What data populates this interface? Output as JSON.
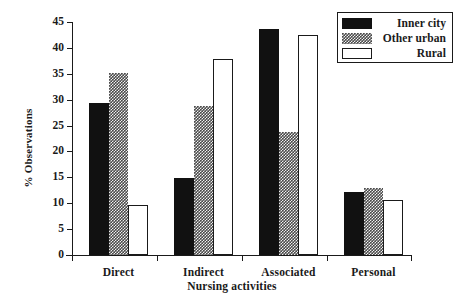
{
  "chart_data": {
    "type": "bar",
    "title": "",
    "xlabel": "Nursing activities",
    "ylabel": "% Observations",
    "categories": [
      "Direct",
      "Indirect",
      "Associated",
      "Personal"
    ],
    "series": [
      {
        "name": "Inner city",
        "values": [
          29.3,
          14.8,
          43.7,
          12.2
        ]
      },
      {
        "name": "Other urban",
        "values": [
          35.2,
          28.7,
          23.8,
          12.9
        ]
      },
      {
        "name": "Rural",
        "values": [
          9.7,
          37.8,
          42.4,
          10.7
        ]
      }
    ],
    "ylim": [
      0,
      45
    ],
    "yticks": [
      0,
      5,
      10,
      15,
      20,
      25,
      30,
      35,
      40,
      45
    ],
    "ytick_labels": [
      "0",
      "5",
      "10",
      "15",
      "20",
      "25",
      "30",
      "35",
      "40",
      "45"
    ],
    "grid": false,
    "legend_position": "top-right",
    "colors": {
      "inner_city": "#111111",
      "other_urban": "#4a4a4a",
      "rural": "#ffffff",
      "axis": "#1a1a1a"
    }
  },
  "legend": {
    "entries": [
      {
        "label": "Inner city",
        "swatch": "inner-city"
      },
      {
        "label": "Other urban",
        "swatch": "other-urban"
      },
      {
        "label": "Rural",
        "swatch": "rural"
      }
    ]
  }
}
